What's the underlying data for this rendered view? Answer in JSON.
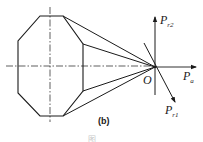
{
  "figure": {
    "subfigure_label": "(b)",
    "truncated_caption": "图"
  },
  "labels": {
    "origin": "O",
    "force_radial_2": {
      "base": "P",
      "sub": "r2"
    },
    "force_axial": {
      "base": "P",
      "sub": "a"
    },
    "force_radial_1": {
      "base": "P",
      "sub": "r1"
    }
  },
  "colors": {
    "line": "#1a1a1a",
    "background": "#ffffff"
  }
}
